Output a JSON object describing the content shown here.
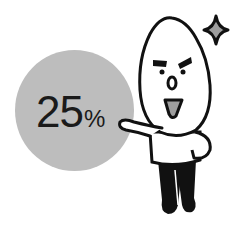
{
  "illustration": {
    "badge": {
      "value": "25",
      "unit": "%",
      "fill_color": "#bdbdbd"
    },
    "character": {
      "type": "rice-grain mascot",
      "pose": "presenting",
      "accent_color": "#9e9e9e"
    },
    "sparkle": {
      "fill_color": "#9e9e9e"
    }
  }
}
